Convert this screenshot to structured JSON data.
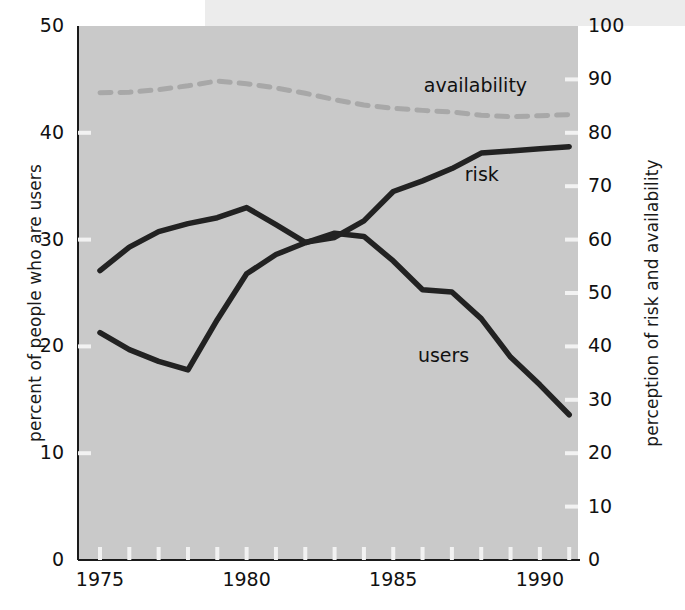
{
  "chart_data": {
    "type": "line",
    "title": "",
    "xlabel": "",
    "ylabel": "percent of people who are users",
    "ylabel_right": "perception of risk and availability",
    "xlim": [
      1974.25,
      1991.3
    ],
    "ylim": [
      0,
      50
    ],
    "ylim_right": [
      0,
      100
    ],
    "grid": false,
    "legend": "inline-annotations",
    "xticks": [
      1975,
      1980,
      1985,
      1990
    ],
    "xtick_labels": [
      "1975",
      "1980",
      "1985",
      "1990"
    ],
    "xticks_minor": [
      1976,
      1977,
      1978,
      1979,
      1981,
      1982,
      1983,
      1984,
      1986,
      1987,
      1988,
      1989,
      1991
    ],
    "yticks_left": [
      0,
      10,
      20,
      30,
      40,
      50
    ],
    "ytick_labels_left": [
      "0",
      "10",
      "20",
      "30",
      "40",
      "50"
    ],
    "yticks_right": [
      0,
      10,
      20,
      30,
      40,
      50,
      60,
      70,
      80,
      90,
      100
    ],
    "ytick_labels_right": [
      "0",
      "10",
      "20",
      "30",
      "40",
      "50",
      "60",
      "70",
      "80",
      "90",
      "100"
    ],
    "x": [
      1975,
      1976,
      1977,
      1978,
      1979,
      1980,
      1981,
      1982,
      1983,
      1984,
      1985,
      1986,
      1987,
      1988,
      1989,
      1990,
      1991
    ],
    "series": [
      {
        "name": "users",
        "axis": "left",
        "style": "solid",
        "color": "#222222",
        "label": "users",
        "label_x": 1987.0,
        "label_y": 19.0,
        "values": [
          21.3,
          19.7,
          18.6,
          17.8,
          22.5,
          26.8,
          28.6,
          29.7,
          30.6,
          30.3,
          28.0,
          25.3,
          25.1,
          22.6,
          19.0,
          16.4,
          13.6
        ]
      },
      {
        "name": "risk",
        "axis": "right",
        "style": "solid",
        "color": "#222222",
        "label": "risk",
        "label_x": 1988.6,
        "label_y": 72.0,
        "values": [
          54.2,
          58.6,
          61.5,
          63.0,
          64.1,
          66.0,
          62.8,
          59.5,
          60.4,
          63.5,
          69.0,
          71.0,
          73.3,
          76.2,
          76.6,
          77.0,
          77.4
        ]
      },
      {
        "name": "availability",
        "axis": "right",
        "style": "dashed",
        "color": "#a8a8a8",
        "label": "availability",
        "label_x": 1987.2,
        "label_y": 88.5,
        "values": [
          87.5,
          87.6,
          88.1,
          88.8,
          89.7,
          89.2,
          88.4,
          87.4,
          86.2,
          85.2,
          84.6,
          84.2,
          83.9,
          83.3,
          83.0,
          83.2,
          83.4
        ]
      }
    ]
  },
  "colors": {
    "plot_background": "#c9c9c9",
    "page_background": "#ffffff",
    "line_dark": "#222222",
    "line_light": "#a8a8a8",
    "tick_light": "#f2f2f2",
    "text": "#111111"
  }
}
